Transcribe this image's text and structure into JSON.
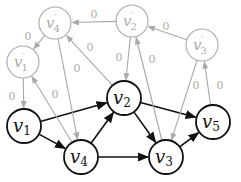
{
  "colors": {
    "primary": "#111111",
    "secondary": "#aaaaaa",
    "background": "#ffffff"
  },
  "nodes": [
    {
      "id": "v1",
      "base": "v",
      "sub": "1",
      "prime": false,
      "x": 24,
      "y": 126,
      "r": 17,
      "style": "primary"
    },
    {
      "id": "v2",
      "base": "v",
      "sub": "2",
      "prime": false,
      "x": 124,
      "y": 98,
      "r": 17,
      "style": "primary"
    },
    {
      "id": "v3",
      "base": "v",
      "sub": "3",
      "prime": false,
      "x": 166,
      "y": 157,
      "r": 17,
      "style": "primary"
    },
    {
      "id": "v4",
      "base": "v",
      "sub": "4",
      "prime": false,
      "x": 81,
      "y": 157,
      "r": 17,
      "style": "primary"
    },
    {
      "id": "v5",
      "base": "v",
      "sub": "5",
      "prime": false,
      "x": 213,
      "y": 122,
      "r": 17,
      "style": "primary"
    },
    {
      "id": "v1p",
      "base": "v",
      "sub": "1",
      "prime": true,
      "x": 23,
      "y": 62,
      "r": 16,
      "style": "secondary"
    },
    {
      "id": "v2p",
      "base": "v",
      "sub": "2",
      "prime": true,
      "x": 132,
      "y": 21,
      "r": 16,
      "style": "secondary"
    },
    {
      "id": "v3p",
      "base": "v",
      "sub": "3",
      "prime": true,
      "x": 202,
      "y": 45,
      "r": 16,
      "style": "secondary"
    },
    {
      "id": "v4p",
      "base": "v",
      "sub": "4",
      "prime": true,
      "x": 55,
      "y": 23,
      "r": 16,
      "style": "secondary"
    }
  ],
  "edges": [
    {
      "from": "v1",
      "to": "v2",
      "style": "primary",
      "label": ""
    },
    {
      "from": "v1",
      "to": "v4",
      "style": "primary",
      "label": ""
    },
    {
      "from": "v4",
      "to": "v2",
      "style": "primary",
      "label": ""
    },
    {
      "from": "v2",
      "to": "v3",
      "style": "primary",
      "label": ""
    },
    {
      "from": "v2",
      "to": "v5",
      "style": "primary",
      "label": ""
    },
    {
      "from": "v4",
      "to": "v3",
      "style": "primary",
      "label": ""
    },
    {
      "from": "v3",
      "to": "v5",
      "style": "primary",
      "label": ""
    },
    {
      "from": "v2p",
      "to": "v4p",
      "style": "secondary",
      "label": "0",
      "lx": 94,
      "ly": 15
    },
    {
      "from": "v3p",
      "to": "v2p",
      "style": "secondary",
      "label": "0",
      "lx": 166,
      "ly": 27
    },
    {
      "from": "v4p",
      "to": "v1p",
      "style": "secondary",
      "label": "0",
      "lx": 28,
      "ly": 37
    },
    {
      "from": "v1p",
      "to": "v1",
      "style": "secondary",
      "label": "0",
      "lx": 12,
      "ly": 97
    },
    {
      "from": "v2",
      "to": "v4p",
      "style": "secondary",
      "label": "0",
      "lx": 90,
      "ly": 48
    },
    {
      "from": "v4p",
      "to": "v4",
      "style": "secondary",
      "label": "0",
      "lx": 77,
      "ly": 69
    },
    {
      "from": "v4",
      "to": "v1p",
      "style": "secondary",
      "label": "0",
      "lx": 55,
      "ly": 95
    },
    {
      "from": "v2p",
      "to": "v2",
      "style": "secondary",
      "label": "0",
      "lx": 119,
      "ly": 58
    },
    {
      "from": "v3",
      "to": "v2p",
      "style": "secondary",
      "label": "0",
      "lx": 152,
      "ly": 60
    },
    {
      "from": "v3p",
      "to": "v3",
      "style": "secondary",
      "label": "0",
      "lx": 196,
      "ly": 86
    },
    {
      "from": "v5",
      "to": "v3p",
      "style": "secondary",
      "label": "0",
      "lx": 220,
      "ly": 86
    }
  ]
}
